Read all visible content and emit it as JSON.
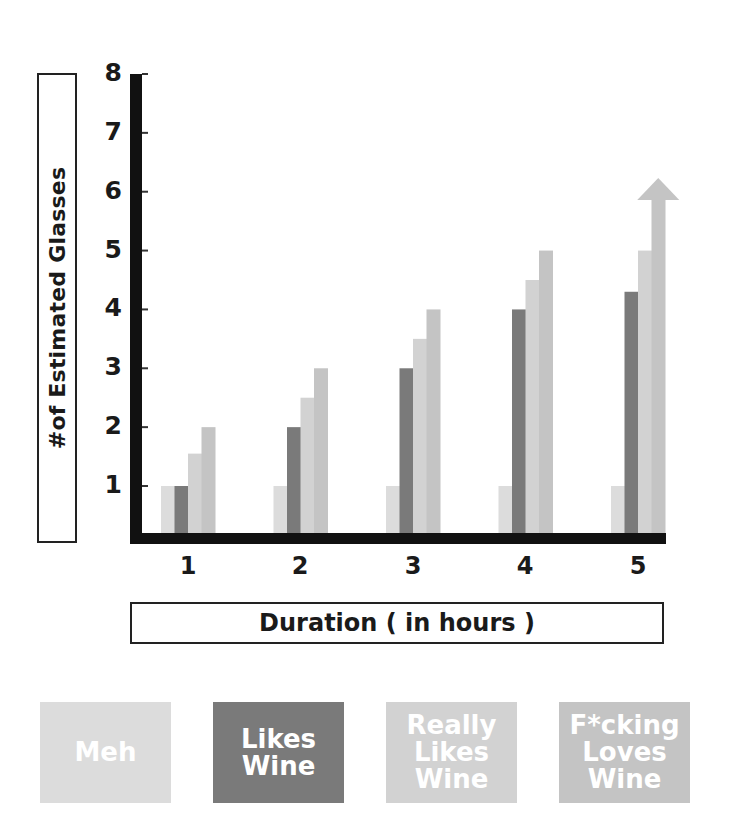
{
  "chart_data": {
    "type": "bar",
    "title": "",
    "xlabel": "Duration ( in hours )",
    "ylabel": "#of Estimated Glasses",
    "ylim": [
      0,
      8
    ],
    "yticks": [
      "1",
      "2",
      "3",
      "4",
      "5",
      "6",
      "7",
      "8"
    ],
    "categories": [
      "1",
      "2",
      "3",
      "4",
      "5"
    ],
    "grid": false,
    "legend_position": "bottom",
    "series": [
      {
        "name": "Meh",
        "color": "#dcdcdc",
        "values": [
          1,
          1,
          1,
          1,
          1
        ]
      },
      {
        "name": "Likes Wine",
        "color": "#7a7a7a",
        "values": [
          1,
          2,
          3,
          4,
          4.3
        ]
      },
      {
        "name": "Really Likes Wine",
        "color": "#d2d2d2",
        "values": [
          1.55,
          2.5,
          3.5,
          4.5,
          5
        ]
      },
      {
        "name": "F*cking Loves Wine",
        "color": "#c4c4c4",
        "values": [
          2,
          3,
          4,
          5,
          6.3
        ]
      }
    ],
    "annotations": [
      {
        "type": "arrow-up",
        "series": "F*cking Loves Wine",
        "category": "5",
        "note": "bar extends upward beyond 6 as an arrow"
      }
    ]
  },
  "axis": {
    "ylabel": "#of Estimated Glasses",
    "xlabel": "Duration ( in hours )",
    "yticks": [
      "1",
      "2",
      "3",
      "4",
      "5",
      "6",
      "7",
      "8"
    ],
    "xticks": [
      "1",
      "2",
      "3",
      "4",
      "5"
    ]
  },
  "legend": [
    {
      "label": "Meh",
      "color": "#dcdcdc"
    },
    {
      "label": "Likes Wine",
      "color": "#7a7a7a"
    },
    {
      "label": "Really Likes Wine",
      "color": "#d2d2d2"
    },
    {
      "label": "F*cking Loves Wine",
      "color": "#c4c4c4"
    }
  ],
  "legend_lines": [
    [
      "Meh"
    ],
    [
      "Likes",
      "Wine"
    ],
    [
      "Really",
      "Likes",
      "Wine"
    ],
    [
      "F*cking",
      "Loves",
      "Wine"
    ]
  ]
}
